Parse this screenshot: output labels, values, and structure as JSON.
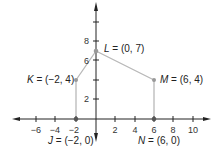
{
  "diagram": {
    "type": "coordinate-plane",
    "x_ticks": [
      "−6",
      "−4",
      "−2",
      "2",
      "4",
      "6",
      "8",
      "10"
    ],
    "y_ticks": [
      "8",
      "6",
      "2"
    ],
    "points": [
      {
        "name": "L",
        "label": " = (0, 7)",
        "x": 0,
        "y": 7
      },
      {
        "name": "K",
        "label": " = (−2, 4)",
        "x": -2,
        "y": 4
      },
      {
        "name": "M",
        "label": " = (6, 4)",
        "x": 6,
        "y": 4
      },
      {
        "name": "J",
        "label": " = (−2, 0)",
        "x": -2,
        "y": 0
      },
      {
        "name": "N",
        "label": " = (6, 0)",
        "x": 6,
        "y": 0
      }
    ],
    "segments": [
      "J-K",
      "K-L",
      "L-M",
      "M-N"
    ],
    "colors": {
      "axis": "#222222",
      "segment": "#b8b8b8",
      "point": "#999999"
    }
  }
}
